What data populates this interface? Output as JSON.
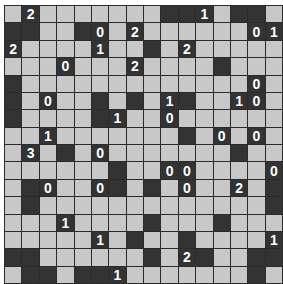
{
  "puzzle": {
    "type": "akari-light-up",
    "rows": 16,
    "cols": 16,
    "legend": {
      ".": "white",
      "#": "black",
      "0-4": "black numbered clue"
    },
    "colors": {
      "white_cell": "#c8c8c8",
      "black_cell": "#333333",
      "grid_line": "#2b2b2b",
      "clue_text": "#ffffff"
    },
    "grid": [
      [
        ".",
        "2",
        ".",
        ".",
        ".",
        ".",
        ".",
        ".",
        ".",
        "#",
        "#",
        "1",
        ".",
        "#",
        "#",
        "."
      ],
      [
        "#",
        "#",
        ".",
        ".",
        "#",
        "0",
        ".",
        "2",
        ".",
        ".",
        ".",
        ".",
        ".",
        ".",
        "0",
        "1"
      ],
      [
        "2",
        ".",
        ".",
        ".",
        ".",
        "1",
        ".",
        ".",
        "#",
        ".",
        "2",
        ".",
        ".",
        ".",
        ".",
        "."
      ],
      [
        ".",
        ".",
        ".",
        "0",
        ".",
        ".",
        ".",
        "2",
        ".",
        ".",
        ".",
        ".",
        "#",
        ".",
        ".",
        "."
      ],
      [
        "#",
        ".",
        ".",
        ".",
        ".",
        ".",
        ".",
        ".",
        ".",
        ".",
        ".",
        ".",
        ".",
        ".",
        "0",
        "."
      ],
      [
        "#",
        ".",
        "0",
        ".",
        ".",
        "#",
        ".",
        "#",
        ".",
        "1",
        "#",
        ".",
        ".",
        "1",
        "0",
        "."
      ],
      [
        "#",
        ".",
        ".",
        ".",
        ".",
        "#",
        "1",
        ".",
        ".",
        "0",
        ".",
        ".",
        ".",
        ".",
        ".",
        "."
      ],
      [
        ".",
        ".",
        "1",
        ".",
        ".",
        ".",
        ".",
        ".",
        ".",
        ".",
        "#",
        ".",
        "0",
        ".",
        "0",
        "."
      ],
      [
        ".",
        "3",
        ".",
        "#",
        ".",
        "0",
        ".",
        ".",
        ".",
        ".",
        ".",
        ".",
        ".",
        "#",
        ".",
        "."
      ],
      [
        ".",
        ".",
        ".",
        ".",
        ".",
        ".",
        "#",
        ".",
        ".",
        "0",
        "0",
        ".",
        ".",
        ".",
        ".",
        "0"
      ],
      [
        ".",
        "#",
        "0",
        ".",
        ".",
        "0",
        "#",
        ".",
        "#",
        ".",
        "0",
        ".",
        ".",
        "2",
        ".",
        "#"
      ],
      [
        ".",
        "#",
        ".",
        ".",
        ".",
        ".",
        ".",
        ".",
        ".",
        ".",
        ".",
        ".",
        ".",
        ".",
        ".",
        "#"
      ],
      [
        ".",
        ".",
        ".",
        "1",
        ".",
        ".",
        ".",
        ".",
        "#",
        ".",
        ".",
        ".",
        "#",
        ".",
        ".",
        "."
      ],
      [
        ".",
        ".",
        ".",
        ".",
        ".",
        "1",
        ".",
        "#",
        ".",
        ".",
        "#",
        ".",
        ".",
        ".",
        ".",
        "1"
      ],
      [
        "#",
        "#",
        ".",
        ".",
        ".",
        ".",
        ".",
        ".",
        "#",
        ".",
        "2",
        "#",
        ".",
        ".",
        "#",
        "#"
      ],
      [
        ".",
        "#",
        "#",
        ".",
        "#",
        "#",
        "1",
        ".",
        ".",
        ".",
        ".",
        ".",
        ".",
        ".",
        "#",
        "."
      ]
    ]
  }
}
